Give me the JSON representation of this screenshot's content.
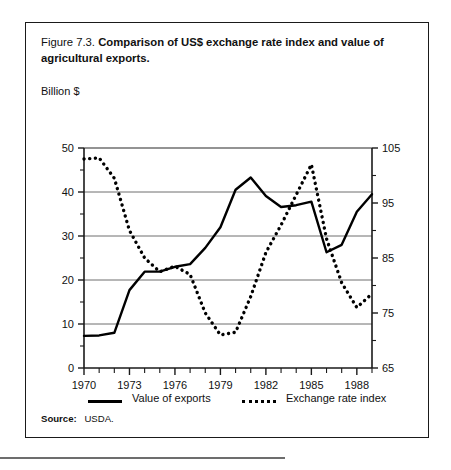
{
  "figure": {
    "label": "Figure 7.3.",
    "title": "Comparison of US$ exchange rate index and value of agricultural exports.",
    "unit_label": "Billion $",
    "source_label": "Source:",
    "source_value": "USDA."
  },
  "legend": {
    "items": [
      {
        "label": "Value of exports",
        "style": "solid"
      },
      {
        "label": "Exchange rate index",
        "style": "dotted"
      }
    ]
  },
  "chart_data": {
    "type": "line",
    "title": "Comparison of US$ exchange rate index and value of agricultural exports.",
    "xlabel": "",
    "ylabel": "Billion $",
    "xlim": [
      1970,
      1989
    ],
    "ylim": [
      0,
      50
    ],
    "y2lim": [
      65,
      105
    ],
    "grid": true,
    "legend_position": "bottom",
    "x_ticks": [
      1970,
      1973,
      1976,
      1979,
      1982,
      1985,
      1988
    ],
    "x_tick_labels": [
      "1970",
      "1973",
      "1976",
      "1979",
      "1982",
      "1985",
      "1988"
    ],
    "x_minor_ticks": [
      1971,
      1972,
      1974,
      1975,
      1977,
      1978,
      1980,
      1981,
      1983,
      1984,
      1986,
      1987,
      1989
    ],
    "y_ticks": [
      0,
      10,
      20,
      30,
      40,
      50
    ],
    "y_tick_labels": [
      "0",
      "10",
      "20",
      "30",
      "40",
      "50"
    ],
    "y_minor_ticks": [
      5,
      15,
      25,
      35,
      45
    ],
    "y2_ticks": [
      65,
      75,
      85,
      95,
      105
    ],
    "y2_tick_labels": [
      "65",
      "75",
      "85",
      "95",
      "105"
    ],
    "y2_minor_ticks": [
      70,
      80,
      90,
      100
    ],
    "x": [
      1970,
      1971,
      1972,
      1973,
      1974,
      1975,
      1976,
      1977,
      1978,
      1979,
      1980,
      1981,
      1982,
      1983,
      1984,
      1985,
      1986,
      1987,
      1988,
      1989
    ],
    "series": [
      {
        "name": "Value of exports",
        "style": "solid",
        "axis": "left",
        "unit": "Billion $",
        "values": [
          7.3,
          7.4,
          8.0,
          17.7,
          21.9,
          21.9,
          23.0,
          23.6,
          27.3,
          32.0,
          40.5,
          43.3,
          39.1,
          36.6,
          37.0,
          37.8,
          26.3,
          28.0,
          35.5,
          39.5
        ]
      },
      {
        "name": "Exchange rate index",
        "style": "dotted",
        "axis": "right",
        "unit": "index",
        "values": [
          103.0,
          103.2,
          99.5,
          90.0,
          85.0,
          82.5,
          83.5,
          82.0,
          75.0,
          71.0,
          71.5,
          78.0,
          86.0,
          91.0,
          96.5,
          102.0,
          88.5,
          80.5,
          76.0,
          78.5
        ]
      }
    ]
  }
}
